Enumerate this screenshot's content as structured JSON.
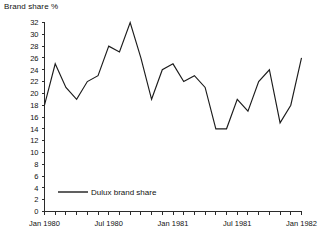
{
  "chart_data": {
    "type": "line",
    "title": "Brand share %",
    "xlabel": "",
    "ylabel": "",
    "ylim": [
      0,
      32
    ],
    "ytick_step": 2,
    "yticks": [
      0,
      2,
      4,
      6,
      8,
      10,
      12,
      14,
      16,
      18,
      20,
      22,
      24,
      26,
      28,
      30,
      32
    ],
    "grid": false,
    "legend_position": "inside-bottom-left",
    "legend": [
      "Dulux brand share"
    ],
    "x_tick_labels": [
      "Jan 1980",
      "Jul 1980",
      "Jan 1981",
      "Jul 1981",
      "Jan 1982"
    ],
    "x_tick_label_indices": [
      0,
      6,
      12,
      18,
      24
    ],
    "x": [
      "Jan 1980",
      "Feb 1980",
      "Mar 1980",
      "Apr 1980",
      "May 1980",
      "Jun 1980",
      "Jul 1980",
      "Aug 1980",
      "Sep 1980",
      "Oct 1980",
      "Nov 1980",
      "Dec 1980",
      "Jan 1981",
      "Feb 1981",
      "Mar 1981",
      "Apr 1981",
      "May 1981",
      "Jun 1981",
      "Jul 1981",
      "Aug 1981",
      "Sep 1981",
      "Oct 1981",
      "Nov 1981",
      "Dec 1981",
      "Jan 1982"
    ],
    "series": [
      {
        "name": "Dulux brand share",
        "values": [
          18,
          25,
          21,
          19,
          22,
          23,
          28,
          27,
          32,
          26,
          19,
          24,
          25,
          22,
          23,
          21,
          14,
          14,
          19,
          17,
          22,
          24,
          15,
          18,
          26
        ]
      }
    ],
    "colors": {
      "series_line": "#1c1c1c",
      "axis": "#2b2b2b",
      "text": "#111111",
      "background": "#ffffff"
    }
  }
}
